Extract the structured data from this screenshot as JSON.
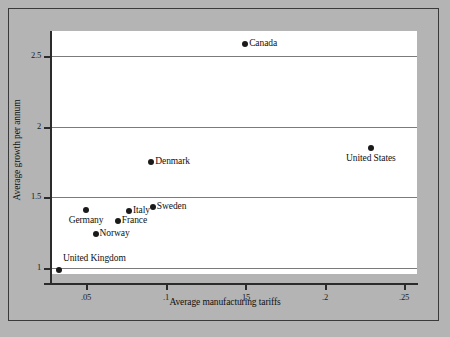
{
  "chart_data": {
    "type": "scatter",
    "title": "",
    "xlabel": "Average manufacturing tariffs",
    "ylabel": "Average growth per annum",
    "xlim": [
      0.028,
      0.258
    ],
    "ylim": [
      0.955,
      2.68
    ],
    "grid": true,
    "legend": "none",
    "xticks": [
      0.05,
      0.1,
      0.15,
      0.2,
      0.25
    ],
    "xtick_labels": [
      ".05",
      ".1",
      ".15",
      ".2",
      ".25"
    ],
    "yticks": [
      1,
      1.5,
      2,
      2.5
    ],
    "ytick_labels": [
      "1",
      "1.5",
      "2",
      "2.5"
    ],
    "points": [
      {
        "label": "Canada",
        "x": 0.15,
        "y": 2.59,
        "label_pos": "right"
      },
      {
        "label": "United States",
        "x": 0.229,
        "y": 1.85,
        "label_pos": "below"
      },
      {
        "label": "Denmark",
        "x": 0.091,
        "y": 1.75,
        "label_pos": "right"
      },
      {
        "label": "Sweden",
        "x": 0.092,
        "y": 1.43,
        "label_pos": "right"
      },
      {
        "label": "Italy",
        "x": 0.077,
        "y": 1.4,
        "label_pos": "right"
      },
      {
        "label": "Germany",
        "x": 0.05,
        "y": 1.41,
        "label_pos": "below"
      },
      {
        "label": "France",
        "x": 0.07,
        "y": 1.33,
        "label_pos": "right"
      },
      {
        "label": "Norway",
        "x": 0.056,
        "y": 1.24,
        "label_pos": "right"
      },
      {
        "label": "United Kingdom",
        "x": 0.033,
        "y": 0.98,
        "label_pos": "above-right"
      }
    ]
  },
  "colors": {
    "background": "#b4b4b4",
    "plot_background": "#ffffff",
    "gridline": "#7b7b7b",
    "axis": "#2b2b2b",
    "marker": "#1a1a1a",
    "text": "#101010",
    "frame_border": "#3a3a3a"
  }
}
